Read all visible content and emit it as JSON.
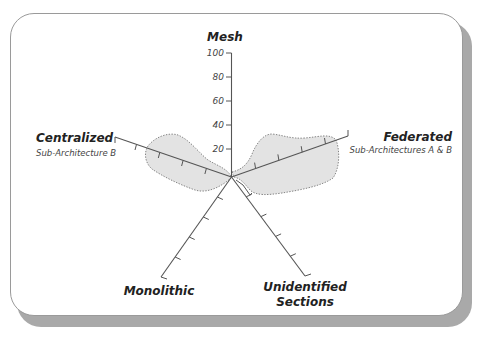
{
  "diagram": {
    "type": "radar",
    "center": [
      231.5,
      177
    ],
    "scale": {
      "ticks": [
        "20",
        "40",
        "60",
        "80",
        "100"
      ],
      "min": 0,
      "max": 100
    },
    "axes": [
      {
        "id": "mesh",
        "label": "Mesh",
        "sublabel": ""
      },
      {
        "id": "federated",
        "label": "Federated",
        "sublabel": "Sub-Architectures A & B"
      },
      {
        "id": "unidentified",
        "label": "Unidentified",
        "label2": "Sections",
        "sublabel": ""
      },
      {
        "id": "monolithic",
        "label": "Monolithic",
        "sublabel": ""
      },
      {
        "id": "centralized",
        "label": "Centralized",
        "sublabel": "Sub-Architecture B"
      }
    ],
    "regions": [
      {
        "name": "centralized-region",
        "axis": "Centralized",
        "approx_extent": "~20 to ~80 along Centralized axis"
      },
      {
        "name": "federated-region",
        "axis": "Federated",
        "approx_extent": "~20 to ~95 along Federated axis"
      }
    ],
    "colors": {
      "region_fill": "#e3e3e3",
      "axis": "#555555",
      "card_shadow": "#a9a9a9"
    }
  }
}
